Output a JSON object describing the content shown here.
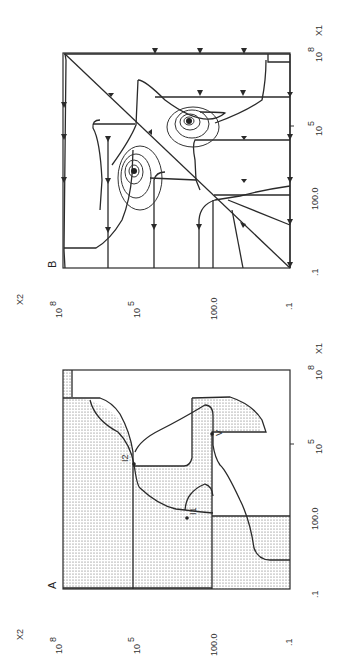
{
  "figure": {
    "panels": [
      {
        "id": "B",
        "label": "B",
        "x_axis_label": "X1",
        "y_axis_label": "X2",
        "x_ticks": [
          ".1",
          "100.0",
          "10",
          "10"
        ],
        "x_tick_exponents": [
          "",
          "",
          "5",
          "8"
        ],
        "y_ticks": [
          ".1",
          "100.0",
          "10",
          "10"
        ],
        "y_tick_exponents": [
          "",
          "",
          "5",
          "8"
        ],
        "content": "phase portrait with trajectories, arrows and two spiral foci"
      },
      {
        "id": "A",
        "label": "A",
        "x_axis_label": "X1",
        "y_axis_label": "X2",
        "x_ticks": [
          ".1",
          "100.0",
          "10",
          "10"
        ],
        "x_tick_exponents": [
          "",
          "",
          "5",
          "8"
        ],
        "y_ticks": [
          ".1",
          "100.0",
          "10",
          "10"
        ],
        "y_tick_exponents": [
          "",
          "",
          "5",
          "8"
        ],
        "content": "nullclines with stippled region and marked intersections",
        "point_labels": [
          "I1",
          "I2",
          "V"
        ]
      }
    ]
  }
}
